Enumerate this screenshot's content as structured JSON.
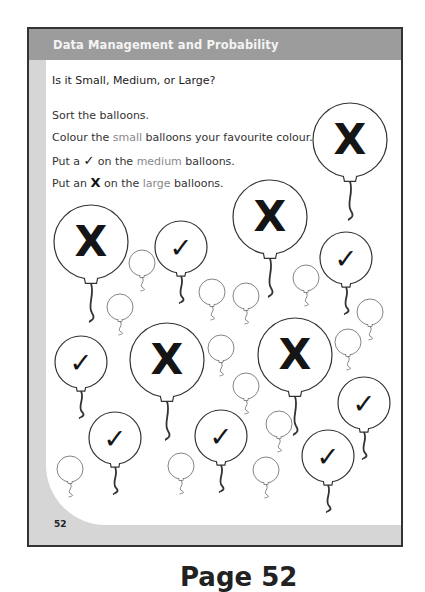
{
  "header": {
    "title": "Data Management and Probability"
  },
  "worksheet": {
    "subtitle": "Is it Small, Medium, or Large?",
    "instructions": [
      {
        "pre": "Sort the balloons.",
        "highlight": "",
        "post": ""
      },
      {
        "pre": "Colour the ",
        "highlight": "small",
        "post": " balloons your favourite colour."
      },
      {
        "pre": "Put a ",
        "glyph": "✓",
        "mid": " on the ",
        "highlight": "medium",
        "post": " balloons."
      },
      {
        "pre": "Put an ",
        "glyph": "X",
        "mid": " on the ",
        "highlight": "large",
        "post": " balloons."
      }
    ],
    "page_number": "52"
  },
  "balloons": {
    "large_mark": "X",
    "medium_mark": "✓",
    "large": [
      [
        350,
        140
      ],
      [
        91,
        242
      ],
      [
        270,
        217
      ],
      [
        167,
        360
      ],
      [
        295,
        355
      ]
    ],
    "medium": [
      [
        181,
        247
      ],
      [
        346,
        258
      ],
      [
        81,
        362
      ],
      [
        364,
        403
      ],
      [
        115,
        438
      ],
      [
        221,
        436
      ],
      [
        328,
        456
      ]
    ],
    "small": [
      [
        142,
        263
      ],
      [
        120,
        307
      ],
      [
        212,
        292
      ],
      [
        246,
        296
      ],
      [
        306,
        278
      ],
      [
        370,
        312
      ],
      [
        221,
        348
      ],
      [
        348,
        342
      ],
      [
        246,
        386
      ],
      [
        279,
        424
      ],
      [
        266,
        470
      ],
      [
        70,
        469
      ],
      [
        181,
        466
      ]
    ]
  },
  "caption": "Page 52",
  "colors": {
    "header_bg": "#9c9c9c",
    "frame": "#333333",
    "margin": "#d6d6d6",
    "highlight_text": "#888888"
  }
}
